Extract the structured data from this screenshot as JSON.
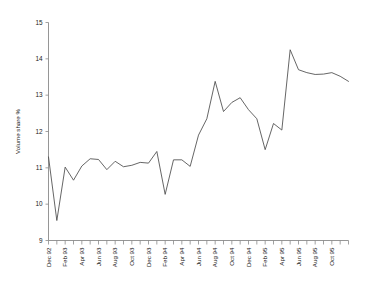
{
  "chart_data": {
    "type": "line",
    "title": "",
    "xlabel": "",
    "ylabel": "Volume share %",
    "ylim": [
      9,
      15
    ],
    "yticks": [
      9,
      10,
      11,
      12,
      13,
      14,
      15
    ],
    "grid": false,
    "legend": null,
    "x": [
      "Dec 92",
      "Jan 93",
      "Feb 93",
      "Mar 93",
      "Apr 93",
      "May 93",
      "Jun 93",
      "Jul 93",
      "Aug 93",
      "Sep 93",
      "Oct 93",
      "Nov 93",
      "Dec 93",
      "Jan 94",
      "Feb 94",
      "Mar 94",
      "Apr 94",
      "May 94",
      "Jun 94",
      "Jul 94",
      "Aug 94",
      "Sep 94",
      "Oct 94",
      "Nov 94",
      "Dec 94",
      "Jan 95",
      "Feb 95",
      "Mar 95",
      "Apr 95",
      "May 95",
      "Jun 95",
      "Jul 95",
      "Aug 95",
      "Sep 95",
      "Oct 95",
      "Nov 95",
      "Dec 95"
    ],
    "xtick_labels": [
      "Dec 92",
      "Feb 93",
      "Apr 93",
      "Jun 93",
      "Aug 93",
      "Oct 93",
      "Dec 93",
      "Feb 94",
      "Apr 94",
      "Jun 94",
      "Aug 94",
      "Oct 94",
      "Dec 94",
      "Feb 95",
      "Apr 95",
      "Jun 95",
      "Aug 95",
      "Oct 95"
    ],
    "xtick_indices": [
      0,
      2,
      4,
      6,
      8,
      10,
      12,
      14,
      16,
      18,
      20,
      22,
      24,
      26,
      28,
      30,
      32,
      34
    ],
    "series": [
      {
        "name": "Volume share",
        "color": "#4a4a4a",
        "values": [
          11.3,
          9.55,
          11.02,
          10.66,
          11.05,
          11.25,
          11.23,
          10.95,
          11.18,
          11.03,
          11.07,
          11.15,
          11.13,
          11.45,
          10.27,
          11.22,
          11.22,
          11.04,
          11.9,
          12.35,
          13.38,
          12.55,
          12.8,
          12.93,
          12.6,
          12.35,
          11.5,
          12.22,
          12.04,
          14.25,
          13.7,
          13.62,
          13.57,
          13.58,
          13.62,
          13.52,
          13.38
        ]
      }
    ]
  }
}
